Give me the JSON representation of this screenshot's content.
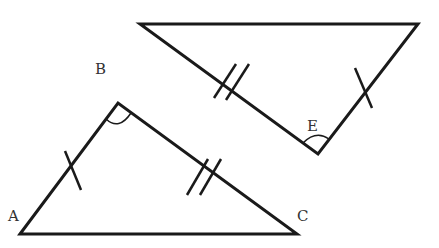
{
  "diagram": {
    "type": "congruent-triangles",
    "stroke_color": "#1a1a1a",
    "label_color": "#333333",
    "labels": {
      "A": "A",
      "B": "B",
      "C": "C",
      "E": "E"
    },
    "triangle_ABC": {
      "vertices": {
        "A": [
          20,
          234
        ],
        "B": [
          118,
          103
        ],
        "C": [
          297,
          234
        ]
      },
      "marks": {
        "AB": "single-tick",
        "BC": "double-tick",
        "angle_B": "arc"
      }
    },
    "triangle_upper": {
      "vertices": {
        "top_left": [
          140,
          24
        ],
        "top_right": [
          418,
          24
        ],
        "E": [
          318,
          154
        ]
      },
      "marks": {
        "left_side": "double-tick",
        "right_side": "single-tick",
        "angle_E": "arc"
      }
    }
  }
}
